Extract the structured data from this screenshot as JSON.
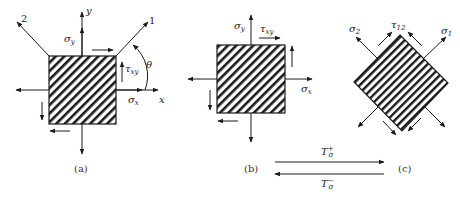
{
  "figure": {
    "panels": [
      {
        "id": "a",
        "caption": "(a)",
        "element": "square",
        "hatch": "diagonal",
        "labels": {
          "y_axis": "y",
          "x_axis": "x",
          "axis_1": "1",
          "axis_2": "2",
          "sigma_y": "σ",
          "sigma_y_sub": "y",
          "sigma_x": "σ",
          "sigma_x_sub": "x",
          "tau_xy": "τ",
          "tau_xy_sub": "xy",
          "theta": "θ"
        }
      },
      {
        "id": "b",
        "caption": "(b)",
        "element": "square",
        "hatch": "diagonal",
        "labels": {
          "sigma_y": "σ",
          "sigma_y_sub": "y",
          "sigma_x": "σ",
          "sigma_x_sub": "x",
          "tau_xy": "τ",
          "tau_xy_sub": "xy"
        }
      },
      {
        "id": "c",
        "caption": "(c)",
        "element": "rotated-square",
        "hatch": "parallel-to-1",
        "labels": {
          "sigma_1": "σ",
          "sigma_1_sub": "1",
          "sigma_2": "σ",
          "sigma_2_sub": "2",
          "tau_12": "τ",
          "tau_12_sub": "12"
        }
      }
    ],
    "transforms": {
      "forward": {
        "symbol": "T",
        "sub": "σ",
        "sup": "+"
      },
      "inverse": {
        "symbol": "T",
        "sub": "σ",
        "sup": "−"
      }
    }
  },
  "colors": {
    "stroke": "#1a1a1a",
    "background": "#ffffff"
  }
}
